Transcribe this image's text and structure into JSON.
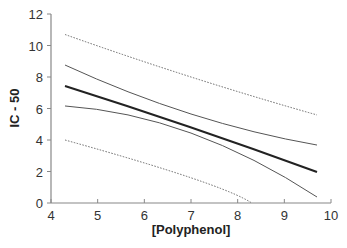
{
  "chart_data": {
    "type": "line",
    "title": "",
    "xlabel": "[Polyphenol]",
    "ylabel": "IC - 50",
    "xlim": [
      4,
      10
    ],
    "ylim": [
      0,
      12
    ],
    "xticks": [
      4,
      5,
      6,
      7,
      8,
      9,
      10
    ],
    "yticks": [
      0,
      2,
      4,
      6,
      8,
      10,
      12
    ],
    "grid": false,
    "legend": null,
    "series": [
      {
        "name": "Regression line",
        "style": "solid-thick",
        "color": "#222222",
        "x": [
          4.3,
          7.0,
          9.7
        ],
        "y": [
          7.43,
          4.8,
          1.97
        ]
      },
      {
        "name": "Upper confidence band",
        "style": "solid-thin",
        "color": "#555555",
        "x": [
          4.3,
          7.0,
          9.7
        ],
        "y": [
          8.76,
          5.65,
          3.68
        ]
      },
      {
        "name": "Lower confidence band",
        "style": "solid-thin",
        "color": "#555555",
        "x": [
          4.3,
          7.0,
          9.7
        ],
        "y": [
          6.16,
          4.44,
          0.38
        ]
      },
      {
        "name": "Upper prediction band",
        "style": "dotted",
        "color": "#666666",
        "x": [
          4.3,
          7.0,
          9.7
        ],
        "y": [
          10.7,
          8.0,
          5.59
        ]
      },
      {
        "name": "Lower prediction band",
        "style": "dotted",
        "color": "#666666",
        "x": [
          4.3,
          7.0,
          8.3
        ],
        "y": [
          4.0,
          1.6,
          0.0
        ]
      }
    ]
  }
}
